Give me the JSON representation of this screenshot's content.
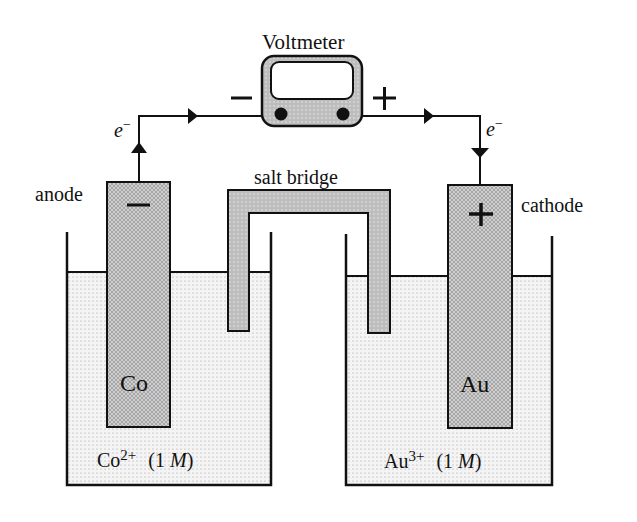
{
  "diagram": {
    "voltmeter": {
      "label": "Voltmeter",
      "negative_terminal": "−",
      "positive_terminal": "+"
    },
    "electron_left": {
      "symbol": "e",
      "charge": "−"
    },
    "electron_right": {
      "symbol": "e",
      "charge": "−"
    },
    "anode": {
      "label": "anode",
      "sign": "−",
      "metal": "Co"
    },
    "cathode": {
      "label": "cathode",
      "sign": "+",
      "metal": "Au"
    },
    "salt_bridge": {
      "label": "salt bridge"
    },
    "left_solution": {
      "ion": "Co",
      "charge": "2+",
      "conc_open": "(1 ",
      "conc_unit": "M",
      "conc_close": ")"
    },
    "right_solution": {
      "ion": "Au",
      "charge": "3+",
      "conc_open": "(1 ",
      "conc_unit": "M",
      "conc_close": ")"
    },
    "colors": {
      "line": "#111111",
      "electrode_fill": "#c8c8c8",
      "solution_fill": "#f2f2f2",
      "background": "#ffffff"
    }
  }
}
